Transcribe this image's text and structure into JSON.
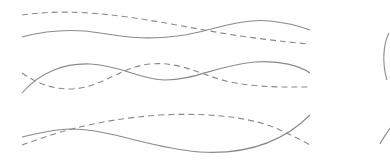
{
  "diagram": {
    "stroke_color": "#8a8a8a",
    "dash_pattern": "6 4",
    "rows": [
      {
        "name": "row-1",
        "solid": "M22,37 C45,31 70,28 100,33 C130,38 150,40 185,35 C215,29 245,18 270,21 C290,23 302,27 310,30",
        "dashed": "M22,15 C50,11 80,11 120,16 C160,21 200,30 240,36 C270,40 295,43 310,44"
      },
      {
        "name": "row-2",
        "solid": "M22,93 C40,72 65,63 90,64 C120,65 140,80 165,80 C195,80 215,66 255,62 C280,60 300,66 310,73",
        "dashed": "M22,73 C35,82 50,89 70,89 C100,89 120,67 150,64 C180,61 200,75 230,82 C260,88 290,87 310,87"
      },
      {
        "name": "row-3",
        "solid": "M22,137 C40,133 55,129 70,129 C110,129 150,148 200,152 C250,155 285,140 310,115",
        "dashed": "M22,145 C50,135 90,120 160,115 C220,112 260,120 280,130 C295,137 305,142 310,145"
      }
    ],
    "circle": {
      "name": "partial-circle",
      "arc_upper": "M389,33 C383,44 382,64 387,80",
      "arc_lower": "M380,144 C383,138 387,133 390,128"
    }
  }
}
